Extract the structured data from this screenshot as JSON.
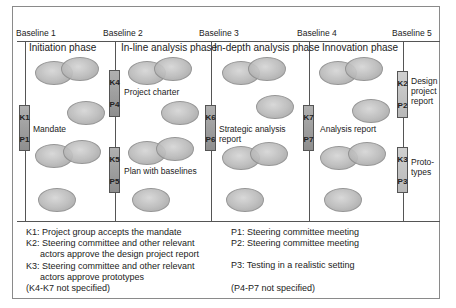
{
  "baselines": [
    {
      "label": "Baseline 1",
      "x": 16
    },
    {
      "label": "Baseline 2",
      "x": 103
    },
    {
      "label": "Baseline 3",
      "x": 199
    },
    {
      "label": "Baseline 4",
      "x": 297
    },
    {
      "label": "Baseline 5",
      "x": 392
    }
  ],
  "phases": [
    {
      "label": "Initiation phase"
    },
    {
      "label": "In-line analysis phase"
    },
    {
      "label": "In-depth analysis phase"
    },
    {
      "label": "Innovation phase"
    }
  ],
  "gates": [
    {
      "k": "K1",
      "p": "P1",
      "deliverable": "Mandate"
    },
    {
      "k": "K4",
      "p": "P4",
      "deliverable": "Project charter"
    },
    {
      "k": "K5",
      "p": "P5",
      "deliverable": "Plan with baselines"
    },
    {
      "k": "K6",
      "p": "P6",
      "deliverable_line1": "Strategic analysis",
      "deliverable_line2": "report"
    },
    {
      "k": "K7",
      "p": "P7",
      "deliverable": "Analysis report"
    },
    {
      "k": "K2",
      "p": "P2",
      "deliverable_line1": "Design",
      "deliverable_line2": "project",
      "deliverable_line3": "report"
    },
    {
      "k": "K3",
      "p": "P3",
      "deliverable_line1": "Proto-",
      "deliverable_line2": "types"
    }
  ],
  "legend": {
    "left": [
      "K1: Project group accepts the mandate",
      "K2: Steering committee and other relevant",
      "actors approve the design project report",
      "K3: Steering committee and other relevant",
      "actors approve prototypes",
      "(K4-K7 not specified)"
    ],
    "right": [
      "P1: Steering committee meeting",
      "P2: Steering committee meeting",
      "P3: Testing in a realistic setting",
      "(P4-P7 not specified)"
    ]
  },
  "colors": {
    "line": "#555555",
    "ellipse": "#b9b9b9",
    "gate_dark": "#9e9e9e",
    "gate_light": "#c4c4c4"
  }
}
